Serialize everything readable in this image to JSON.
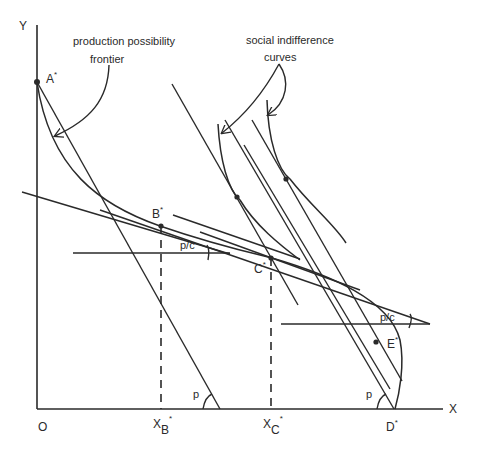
{
  "diagram": {
    "axes": {
      "y_label": "Y",
      "x_label": "X",
      "origin_label": "O"
    },
    "annotations": {
      "ppf_line1": "production possibility",
      "ppf_line2": "frontier",
      "sic_line1": "social indifference",
      "sic_line2": "curves",
      "angle_p_left": "p",
      "angle_p_right": "p",
      "angle_pc_left": "p/c",
      "angle_pc_right": "p/c"
    },
    "points": {
      "A": {
        "label": "A",
        "sup": "*"
      },
      "B": {
        "label": "B",
        "sup": "*"
      },
      "C": {
        "label": "C",
        "sup": "*"
      },
      "D": {
        "label": "D",
        "sup": "*"
      },
      "E": {
        "label": "E",
        "sup": "*"
      }
    },
    "x_ticks": {
      "XB": {
        "label": "X",
        "sub": "B",
        "sup": "*"
      },
      "XC": {
        "label": "X",
        "sub": "C",
        "sup": "*"
      }
    },
    "colors": {
      "ink": "#2a2a2a",
      "background": "#ffffff"
    }
  }
}
